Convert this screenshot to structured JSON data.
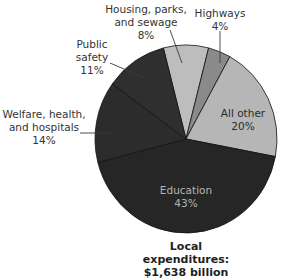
{
  "chart_data": {
    "type": "pie",
    "title": "Local expenditures:",
    "subtitle": "$1,638 billion",
    "categories": [
      "Housing, parks, and sewage",
      "Highways",
      "All other",
      "Education",
      "Welfare, health, and hospitals",
      "Public safety"
    ],
    "values": [
      8,
      4,
      20,
      43,
      14,
      11
    ],
    "unit": "%",
    "start_angle_deg": 345.6,
    "direction": "clockwise",
    "colors": [
      "#bdbdbd",
      "#8a8a8a",
      "#b6b6b6",
      "#262626",
      "#2c2c2c",
      "#2f2f2f"
    ],
    "legend": "none (direct labels)",
    "slices": [
      {
        "label": "Housing, parks, and sewage",
        "value": 8,
        "color": "#bdbdbd"
      },
      {
        "label": "Highways",
        "value": 4,
        "color": "#8a8a8a"
      },
      {
        "label": "All other",
        "value": 20,
        "color": "#b6b6b6"
      },
      {
        "label": "Education",
        "value": 43,
        "color": "#262626"
      },
      {
        "label": "Welfare, health, and hospitals",
        "value": 14,
        "color": "#2c2c2c"
      },
      {
        "label": "Public safety",
        "value": 11,
        "color": "#2f2f2f"
      }
    ]
  },
  "labels": {
    "housing": {
      "line1": "Housing, parks,",
      "line2": "and sewage",
      "pct": "8%"
    },
    "highways": {
      "line1": "Highways",
      "pct": "4%"
    },
    "public_safety": {
      "line1": "Public",
      "line2": "safety",
      "pct": "11%"
    },
    "welfare": {
      "line1": "Welfare, health,",
      "line2": "and hospitals",
      "pct": "14%"
    },
    "all_other": {
      "line1": "All other",
      "pct": "20%"
    },
    "education": {
      "line1": "Education",
      "pct": "43%"
    }
  },
  "caption": {
    "line1": "Local expenditures:",
    "line2": "$1,638 billion"
  }
}
